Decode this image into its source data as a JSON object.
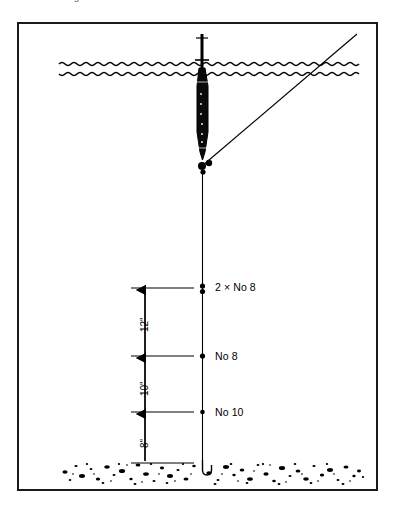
{
  "page": {
    "clipped_caption": "…used as leading",
    "background_color": "#ffffff",
    "frame_color": "#1a1a1a"
  },
  "figure": {
    "ink_color": "#000000",
    "water_surface": {
      "name": "water-surface",
      "style": "double wavy line"
    },
    "seabed": {
      "name": "seabed",
      "style": "stippled gravel band"
    },
    "float": {
      "name": "waggler-float",
      "style": "elongated black float with antenna"
    },
    "mainline": {
      "name": "main-line",
      "style": "vertical thin line"
    },
    "casting_line": {
      "name": "casting-line",
      "style": "diagonal line to upper right"
    },
    "hook": {
      "name": "hook",
      "style": "J-shaped hook at seabed"
    }
  },
  "shots": [
    {
      "label": "2 × No 8",
      "marker": "double-shot",
      "y": 287
    },
    {
      "label": "No 8",
      "marker": "single-shot",
      "y": 357
    },
    {
      "label": "No 10",
      "marker": "single-shot",
      "y": 413
    }
  ],
  "dimensions": [
    {
      "label": "12\"",
      "from_y": 287,
      "to_y": 357
    },
    {
      "label": "10\"",
      "from_y": 357,
      "to_y": 413
    },
    {
      "label": "8\"",
      "from_y": 413,
      "to_y": 464
    }
  ]
}
